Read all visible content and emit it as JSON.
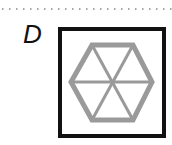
{
  "option": {
    "label": "D",
    "shape": "hexagon-with-spokes-in-square",
    "colors": {
      "frame": "#111111",
      "hexagon": "#9a9a9a",
      "dots": "#888888"
    }
  }
}
